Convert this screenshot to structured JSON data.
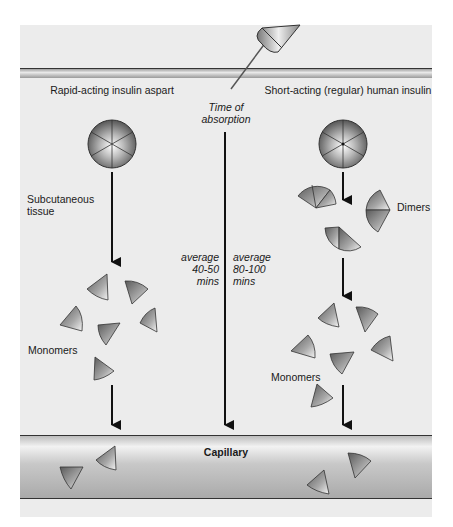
{
  "diagram": {
    "title_left": "Rapid-acting insulin aspart",
    "title_right": "Short-acting (regular) human insulin",
    "center_label_line1": "Time of",
    "center_label_line2": "absorption",
    "left_duration": {
      "line1": "average",
      "line2": "40-50",
      "line3": "mins"
    },
    "right_duration": {
      "line1": "average",
      "line2": "80-100",
      "line3": "mins"
    },
    "subcutaneous_line1": "Subcutaneous",
    "subcutaneous_line2": "tissue",
    "dimers_label": "Dimers",
    "monomers_label_left": "Monomers",
    "monomers_label_right": "Monomers",
    "capillary_label": "Capillary",
    "icons": {
      "needle": "syringe-needle-icon",
      "hexamer": "hexamer-sphere-icon",
      "dimer": "dimer-wedge-icon",
      "monomer": "monomer-wedge-icon",
      "arrow": "arrow-down-icon"
    },
    "colors": {
      "panel_bg": "#ececec",
      "skin_band": "#bdbdbd",
      "capillary_fill": "#c4c4c4",
      "outline": "#333333",
      "arrow": "#111111"
    }
  }
}
